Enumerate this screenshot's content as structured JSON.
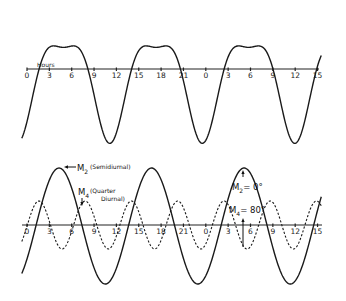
{
  "top_panel": {
    "axis_label": "Hours",
    "tick_labels": [
      "0",
      "3",
      "6",
      "9",
      "12",
      "15",
      "18",
      "21",
      "0",
      "3",
      "6",
      "9",
      "12",
      "15"
    ],
    "curve_description": "Combined tide (M2 + M4) with flattened double-peaked highs and deep lows"
  },
  "bottom_panel": {
    "tick_labels": [
      "0",
      "3",
      "6",
      "9",
      "12",
      "15",
      "18",
      "21",
      "0",
      "3",
      "6",
      "9",
      "12",
      "15"
    ],
    "m2_label": {
      "main": "M",
      "sub": "2",
      "note": "(Semidiurnal)"
    },
    "m4_label": {
      "main": "M",
      "sub": "4",
      "note_line1": "(Quarter",
      "note_line2": "Diurnal)"
    },
    "phase_m2": {
      "main": "M",
      "sub": "2",
      "value": "= 0°"
    },
    "phase_m4": {
      "main": "M",
      "sub": "4",
      "value": "= 80°"
    }
  },
  "chart_data": {
    "type": "line",
    "x_unit": "hours",
    "x_range": [
      0,
      39
    ],
    "tick_labels": [
      "0",
      "3",
      "6",
      "9",
      "12",
      "15",
      "18",
      "21",
      "0",
      "3",
      "6",
      "9",
      "12",
      "15"
    ],
    "series": [
      {
        "name": "Combined tide (M2 + M4)",
        "panel": "top",
        "style": "solid"
      },
      {
        "name": "M2 (Semidiurnal)",
        "panel": "bottom",
        "style": "solid",
        "period_hours": 12.42,
        "phase_deg": 0
      },
      {
        "name": "M4 (Quarter Diurnal)",
        "panel": "bottom",
        "style": "dashed",
        "period_hours": 6.21,
        "phase_deg": 80
      }
    ],
    "annotations": [
      "M2 = 0°",
      "M4 = 80°",
      "Hours"
    ]
  }
}
